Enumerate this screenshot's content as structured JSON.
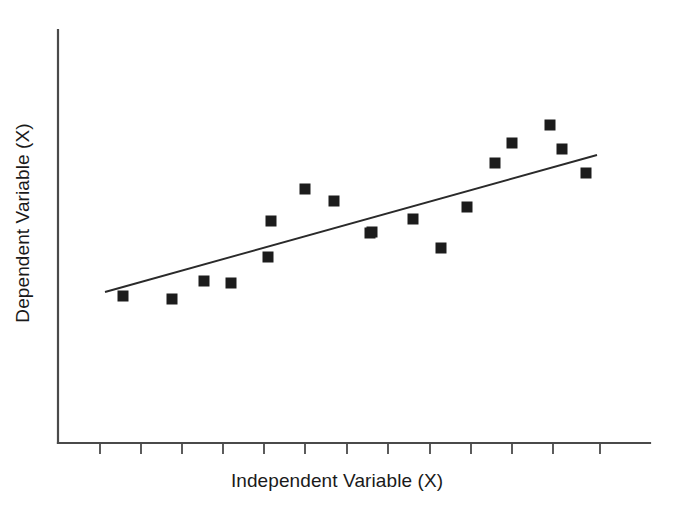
{
  "chart_data": {
    "type": "scatter",
    "title": "",
    "xlabel": "Independent Variable (X)",
    "ylabel": "Dependent Variable (X)",
    "grid": false,
    "legend": null,
    "xlim": [
      0,
      11
    ],
    "ylim": [
      0,
      10
    ],
    "x_tick_labels": [
      "",
      "",
      "",
      "",
      "",
      "",
      "",
      "",
      "",
      "",
      ""
    ],
    "y_tick_labels": [],
    "n_points": 18,
    "points": [
      {
        "x": 1.1,
        "y": 3.3,
        "px": 123,
        "py": 296
      },
      {
        "x": 2.3,
        "y": 3.25,
        "px": 172,
        "py": 299
      },
      {
        "x": 3.1,
        "y": 3.7,
        "px": 204,
        "py": 281
      },
      {
        "x": 3.75,
        "y": 3.65,
        "px": 231,
        "py": 283
      },
      {
        "x": 4.65,
        "y": 4.25,
        "px": 268,
        "py": 257
      },
      {
        "x": 4.8,
        "y": 5.15,
        "px": 271,
        "py": 221
      },
      {
        "x": 5.55,
        "y": 5.9,
        "px": 305,
        "py": 189
      },
      {
        "x": 6.25,
        "y": 5.6,
        "px": 334,
        "py": 201
      },
      {
        "x": 7.2,
        "y": 4.85,
        "px": 372,
        "py": 232
      },
      {
        "x": 8.2,
        "y": 5.15,
        "px": 413,
        "py": 219
      },
      {
        "x": 8.9,
        "y": 4.4,
        "px": 441,
        "py": 248
      },
      {
        "x": 9.5,
        "y": 5.4,
        "px": 467,
        "py": 207
      },
      {
        "x": 10.2,
        "y": 6.4,
        "px": 495,
        "py": 163
      },
      {
        "x": 10.6,
        "y": 6.9,
        "px": 512,
        "py": 143
      },
      {
        "x": 11.5,
        "y": 7.35,
        "px": 550,
        "py": 125
      },
      {
        "x": 11.8,
        "y": 6.8,
        "px": 562,
        "py": 149
      },
      {
        "x": 12.4,
        "y": 6.25,
        "px": 586,
        "py": 173
      },
      {
        "x": 7.2,
        "y": 4.85,
        "px": 370,
        "py": 233
      }
    ],
    "trend_line": {
      "kind": "linear-fit",
      "x0_px": 105,
      "y0_px": 292,
      "x1_px": 597,
      "y1_px": 155
    },
    "marker": {
      "shape": "square",
      "size_px": 11,
      "color": "#1c1c1c"
    },
    "axes": {
      "color": "#4a4a4a",
      "x_axis_y_px": 443,
      "x_axis_x0_px": 58,
      "x_axis_x1_px": 650,
      "y_axis_x_px": 58,
      "y_axis_y0_px": 30,
      "y_axis_y1_px": 443,
      "x_ticks_px": [
        100,
        141,
        182,
        223,
        264,
        305,
        347,
        388,
        430,
        471,
        512,
        553,
        600
      ],
      "tick_length_px": 11
    }
  },
  "figure": {
    "background": "#ffffff",
    "width": 674,
    "height": 516
  }
}
